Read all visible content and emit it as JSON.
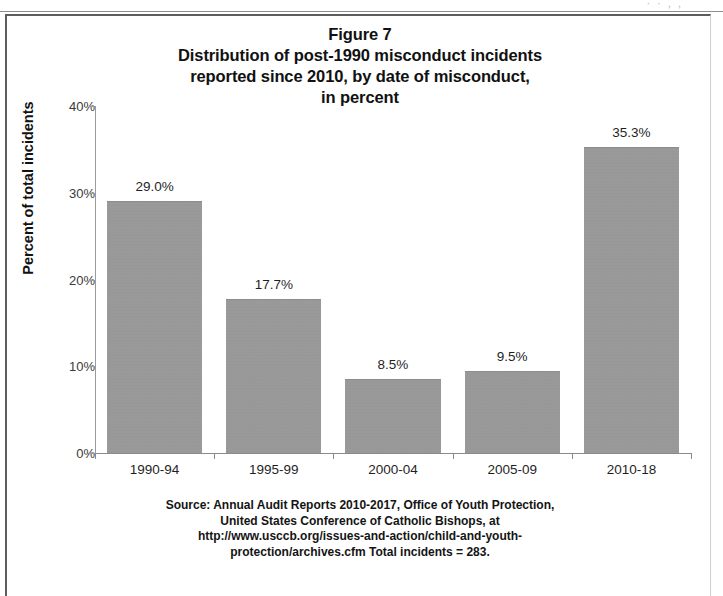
{
  "figure": {
    "title_lines": [
      "Figure 7",
      "Distribution of post-1990 misconduct incidents",
      "reported since 2010, by date of misconduct,",
      "in percent"
    ],
    "source_lines": [
      "Source: Annual Audit Reports 2010-2017, Office of Youth Protection,",
      "United States Conference of Catholic Bishops, at",
      "http://www.usccb.org/issues-and-action/child-and-youth-",
      "protection/archives.cfm Total incidents = 283."
    ],
    "scan_artifact_text": "· ·  ,  ,"
  },
  "chart_data": {
    "type": "bar",
    "xlabel": "",
    "ylabel": "Percent of total incidents",
    "categories": [
      "1990-94",
      "1995-99",
      "2000-04",
      "2005-09",
      "2010-18"
    ],
    "values": [
      29.0,
      17.7,
      8.5,
      9.5,
      35.3
    ],
    "value_labels": [
      "29.0%",
      "17.7%",
      "8.5%",
      "9.5%",
      "35.3%"
    ],
    "ylim": [
      0,
      40
    ],
    "yticks": [
      0,
      10,
      20,
      30,
      40
    ],
    "ytick_labels": [
      "0%",
      "10%",
      "20%",
      "30%",
      "40%"
    ],
    "grid": false,
    "legend": null,
    "bar_color": "#999999",
    "total_incidents": 283
  }
}
